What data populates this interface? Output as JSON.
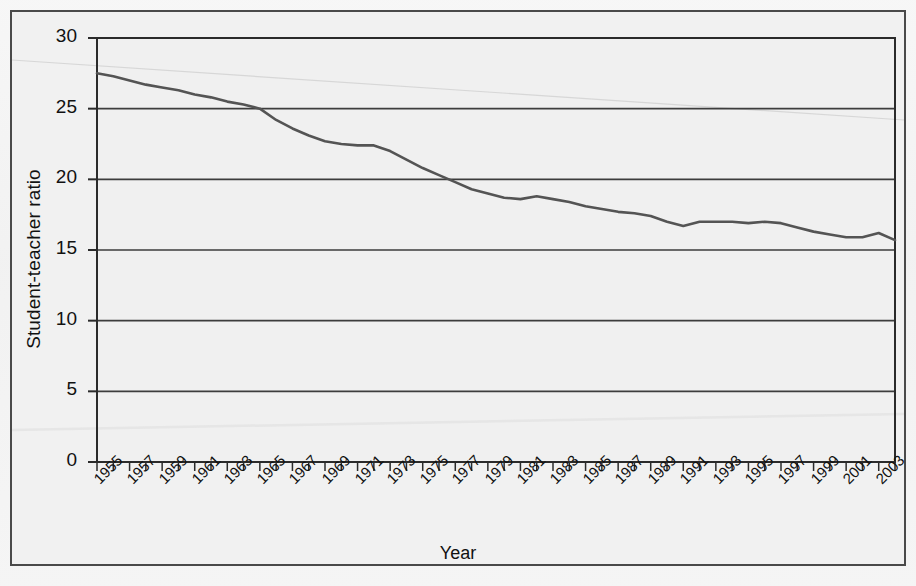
{
  "figure": {
    "clipped_caption_above": "",
    "background_color": "#f1f1f1",
    "frame_color": "#4a4a4a",
    "line_color": "#545454",
    "gridline_color": "#3d3d3d",
    "axis_color": "#2b2b2b"
  },
  "axes": {
    "y_axis_title": "Student-teacher ratio",
    "x_axis_title": "Year",
    "y_ticks": [
      "0",
      "5",
      "10",
      "15",
      "20",
      "25",
      "30"
    ],
    "x_ticks_labeled": [
      "1955",
      "1957",
      "1959",
      "1961",
      "1963",
      "1965",
      "1967",
      "1969",
      "1971",
      "1973",
      "1975",
      "1977",
      "1979",
      "1981",
      "1983",
      "1985",
      "1987",
      "1989",
      "1991",
      "1993",
      "1995",
      "1997",
      "1999",
      "2001",
      "2003"
    ]
  },
  "chart_data": {
    "type": "line",
    "title": "",
    "xlabel": "Year",
    "ylabel": "Student-teacher ratio",
    "xlim": [
      1955,
      2004
    ],
    "ylim": [
      0,
      30
    ],
    "grid": true,
    "legend": false,
    "series_color": "#545454",
    "x": [
      1955,
      1956,
      1957,
      1958,
      1959,
      1960,
      1961,
      1962,
      1963,
      1964,
      1965,
      1966,
      1967,
      1968,
      1969,
      1970,
      1971,
      1972,
      1973,
      1974,
      1975,
      1976,
      1977,
      1978,
      1979,
      1980,
      1981,
      1982,
      1983,
      1984,
      1985,
      1986,
      1987,
      1988,
      1989,
      1990,
      1991,
      1992,
      1993,
      1994,
      1995,
      1996,
      1997,
      1998,
      1999,
      2000,
      2001,
      2002,
      2003,
      2004
    ],
    "series": [
      {
        "name": "Student-teacher ratio",
        "values": [
          27.5,
          27.3,
          27.0,
          26.7,
          26.5,
          26.3,
          26.0,
          25.8,
          25.5,
          25.3,
          25.0,
          24.2,
          23.6,
          23.1,
          22.7,
          22.5,
          22.4,
          22.4,
          22.0,
          21.4,
          20.8,
          20.3,
          19.8,
          19.3,
          19.0,
          18.7,
          18.6,
          18.8,
          18.6,
          18.4,
          18.1,
          17.9,
          17.7,
          17.6,
          17.4,
          17.0,
          16.7,
          17.0,
          17.0,
          17.0,
          16.9,
          17.0,
          16.9,
          16.6,
          16.3,
          16.1,
          15.9,
          15.9,
          16.2,
          15.7
        ]
      }
    ]
  }
}
